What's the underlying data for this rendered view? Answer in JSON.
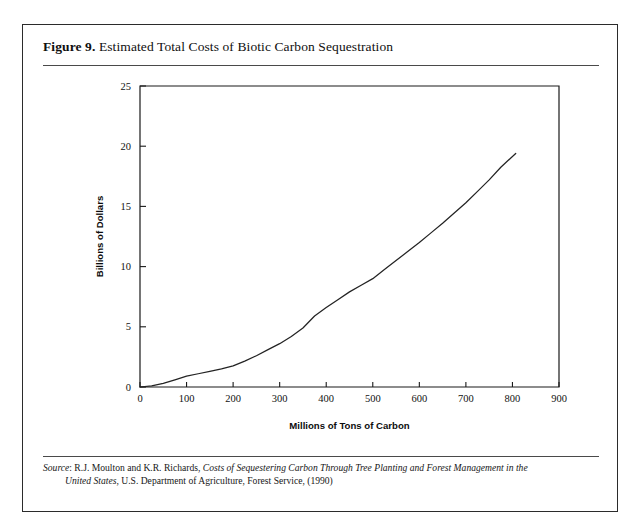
{
  "figure": {
    "number_label": "Figure 9.",
    "title": "Estimated Total Costs of Biotic Carbon Sequestration",
    "source_prefix": "Source",
    "source_line1_a": ": R.J. Moulton and K.R. Richards, ",
    "source_line1_italic": "Costs of Sequestering Carbon Through Tree Planting and Forest Management in the",
    "source_line2_italic": "United States",
    "source_line2_b": ", U.S. Department of Agriculture, Forest Service, (1990)"
  },
  "chart_data": {
    "type": "line",
    "title": "Estimated Total Costs of Biotic Carbon Sequestration",
    "xlabel": "Millions of Tons of Carbon",
    "ylabel": "Billions of Dollars",
    "xlim": [
      0,
      900
    ],
    "ylim": [
      0,
      25
    ],
    "xticks": [
      0,
      100,
      200,
      300,
      400,
      500,
      600,
      700,
      800,
      900
    ],
    "yticks": [
      0,
      5,
      10,
      15,
      20,
      25
    ],
    "xtick_labels": [
      "0",
      "100",
      "200",
      "300",
      "400",
      "500",
      "600",
      "700",
      "800",
      "900"
    ],
    "ytick_labels": [
      "0",
      "5",
      "10",
      "15",
      "20",
      "25"
    ],
    "grid": false,
    "legend": false,
    "line_color": "#232323",
    "series": [
      {
        "name": "Total cost of biotic carbon sequestration",
        "x": [
          0,
          25,
          50,
          75,
          100,
          125,
          150,
          175,
          200,
          225,
          250,
          275,
          300,
          325,
          350,
          375,
          400,
          425,
          450,
          475,
          500,
          525,
          550,
          575,
          600,
          625,
          650,
          675,
          700,
          725,
          750,
          775,
          807
        ],
        "y": [
          0.0,
          0.1,
          0.3,
          0.6,
          0.9,
          1.1,
          1.3,
          1.5,
          1.75,
          2.15,
          2.6,
          3.1,
          3.6,
          4.2,
          4.9,
          5.9,
          6.6,
          7.25,
          7.9,
          8.45,
          9.0,
          9.75,
          10.5,
          11.25,
          12.0,
          12.8,
          13.6,
          14.45,
          15.3,
          16.25,
          17.2,
          18.25,
          19.4
        ]
      }
    ]
  }
}
